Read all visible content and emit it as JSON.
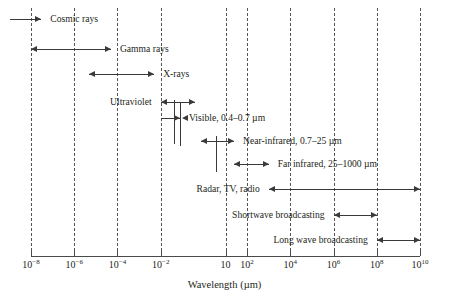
{
  "chart_data": {
    "type": "bar",
    "title": "",
    "xlabel": "Wavelength (µm)",
    "ylabel": "",
    "xscale": "log",
    "xlim": [
      1e-08,
      10000000000.0
    ],
    "grid": true,
    "legend": "none",
    "tick_labels": [
      {
        "text": "10",
        "exp": "−8",
        "value": 1e-08
      },
      {
        "text": "10",
        "exp": "−6",
        "value": 1e-06
      },
      {
        "text": "10",
        "exp": "−4",
        "value": 0.0001
      },
      {
        "text": "10",
        "exp": "−2",
        "value": 0.01
      },
      {
        "text": "10",
        "exp": "",
        "value": 10
      },
      {
        "text": "10",
        "exp": "2",
        "value": 100
      },
      {
        "text": "10",
        "exp": "4",
        "value": 10000
      },
      {
        "text": "10",
        "exp": "6",
        "value": 1000000
      },
      {
        "text": "10",
        "exp": "8",
        "value": 100000000
      },
      {
        "text": "10",
        "exp": "10",
        "value": 10000000000
      }
    ],
    "bands": [
      {
        "name": "cosmic-rays",
        "label": "Cosmic rays",
        "label_side": "right",
        "arrow_start": "open",
        "arrow_end": "right",
        "x_start": 1e-09,
        "x_end": 3e-08
      },
      {
        "name": "gamma-rays",
        "label": "Gamma rays",
        "label_side": "right",
        "arrow_start": "left",
        "arrow_end": "right",
        "x_start": 1e-08,
        "x_end": 5e-05
      },
      {
        "name": "x-rays",
        "label": "X-rays",
        "label_side": "right",
        "arrow_start": "left",
        "arrow_end": "right",
        "x_start": 5e-06,
        "x_end": 0.005
      },
      {
        "name": "ultraviolet",
        "label": "Ultraviolet",
        "label_side": "left",
        "arrow_start": "left",
        "arrow_end": "right",
        "x_start": 0.01,
        "x_end": 0.4
      },
      {
        "name": "visible",
        "label": "Visible, 0.4–0.7 µm",
        "label_side": "right",
        "arrow_start": "right",
        "arrow_end": "left",
        "x_start": 0.01,
        "x_end": 0.7
      },
      {
        "name": "near-infrared",
        "label": "Near-infrared, 0.7–25 µm",
        "label_side": "right",
        "arrow_start": "left",
        "arrow_end": "right",
        "x_start": 0.7,
        "x_end": 25
      },
      {
        "name": "far-infrared",
        "label": "Far infrared, 25–1000 µm",
        "label_side": "right",
        "arrow_start": "left",
        "arrow_end": "right",
        "x_start": 25,
        "x_end": 1000
      },
      {
        "name": "radar-tv-radio",
        "label": "Radar, TV, radio",
        "label_side": "left",
        "arrow_start": "left",
        "arrow_end": "right",
        "x_start": 1000,
        "x_end": 10000000000.0
      },
      {
        "name": "shortwave-broadcasting",
        "label": "Shortwave broadcasting",
        "label_side": "left",
        "arrow_start": "left",
        "arrow_end": "right",
        "x_start": 1000000.0,
        "x_end": 100000000.0
      },
      {
        "name": "long-wave-broadcasting",
        "label": "Long wave broadcasting",
        "label_side": "left",
        "arrow_start": "left",
        "arrow_end": "right",
        "x_start": 100000000.0,
        "x_end": 10000000000.0
      }
    ],
    "colors": {
      "background": "#ffffff",
      "line": "#3a3a3a",
      "axis": "#4a4a4a",
      "grid": "#555555",
      "text": "#231f20"
    }
  }
}
